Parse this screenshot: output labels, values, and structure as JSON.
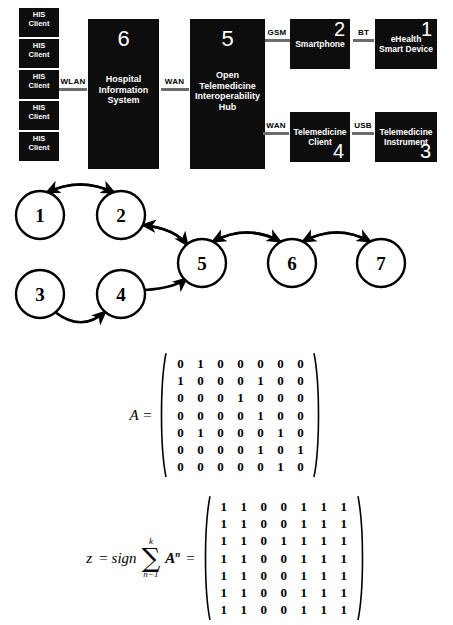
{
  "architecture": {
    "his_clients": [
      {
        "line1": "HIS",
        "line2": "Client"
      },
      {
        "line1": "HIS",
        "line2": "Client"
      },
      {
        "line1": "HIS",
        "line2": "Client"
      },
      {
        "line1": "HIS",
        "line2": "Client"
      },
      {
        "line1": "HIS",
        "line2": "Client"
      }
    ],
    "blocks": {
      "hospital_information_system": {
        "number": "6",
        "line1": "Hospital",
        "line2": "Information",
        "line3": "System"
      },
      "open_telemedicine_hub": {
        "number": "5",
        "line1": "Open",
        "line2": "Telemedicine",
        "line3": "Interoperability",
        "line4": "Hub"
      },
      "smartphone": {
        "number": "2",
        "line1": "Smartphone"
      },
      "ehealth_smart_device": {
        "number": "1",
        "line1": "eHealth",
        "line2": "Smart Device"
      },
      "telemedicine_client": {
        "number": "4",
        "line1": "Telemedicine",
        "line2": "Client"
      },
      "telemedicine_instrument": {
        "number": "3",
        "line1": "Telemedicine",
        "line2": "Instrument"
      }
    },
    "links": {
      "wlan": "WLAN",
      "wan_hub": "WAN",
      "gsm": "GSM",
      "bt": "BT",
      "wan_client": "WAN",
      "usb": "USB"
    },
    "colors": {
      "block_fill": "#0d0d0d",
      "block_text": "#ffffff",
      "connector_bar": "#6b6b6b"
    }
  },
  "graph": {
    "nodes": [
      {
        "id": "1",
        "label": "1",
        "cx": 40,
        "cy": 37
      },
      {
        "id": "2",
        "label": "2",
        "cx": 121,
        "cy": 37
      },
      {
        "id": "3",
        "label": "3",
        "cx": 40,
        "cy": 116
      },
      {
        "id": "4",
        "label": "4",
        "cx": 121,
        "cy": 116
      },
      {
        "id": "5",
        "label": "5",
        "cx": 202,
        "cy": 85
      },
      {
        "id": "6",
        "label": "6",
        "cx": 292,
        "cy": 85
      },
      {
        "id": "7",
        "label": "7",
        "cx": 381,
        "cy": 85
      }
    ],
    "radius": 24,
    "edges": [
      {
        "from": "1",
        "to": "2",
        "bidirectional": true
      },
      {
        "from": "2",
        "to": "5",
        "bidirectional": true
      },
      {
        "from": "3",
        "to": "4",
        "bidirectional": false
      },
      {
        "from": "4",
        "to": "5",
        "bidirectional": false
      },
      {
        "from": "5",
        "to": "6",
        "bidirectional": true
      },
      {
        "from": "6",
        "to": "7",
        "bidirectional": true
      }
    ],
    "colors": {
      "stroke": "#000000",
      "fill": "#ffffff"
    }
  },
  "matrix_a": {
    "label": "A =",
    "rows": [
      [
        "0",
        "1",
        "0",
        "0",
        "0",
        "0",
        "0"
      ],
      [
        "1",
        "0",
        "0",
        "0",
        "1",
        "0",
        "0"
      ],
      [
        "0",
        "0",
        "0",
        "1",
        "0",
        "0",
        "0"
      ],
      [
        "0",
        "0",
        "0",
        "0",
        "1",
        "0",
        "0"
      ],
      [
        "0",
        "1",
        "0",
        "0",
        "0",
        "1",
        "0"
      ],
      [
        "0",
        "0",
        "0",
        "0",
        "1",
        "0",
        "1"
      ],
      [
        "0",
        "0",
        "0",
        "0",
        "0",
        "1",
        "0"
      ]
    ]
  },
  "equation_z": {
    "z": "z",
    "equals": "=",
    "sign": "sign",
    "sigma": "∑",
    "upper_limit": "k",
    "lower_limit": "n−1",
    "term_base": "A",
    "term_exponent": "n",
    "equals2": "=",
    "rows": [
      [
        "1",
        "1",
        "0",
        "0",
        "1",
        "1",
        "1"
      ],
      [
        "1",
        "1",
        "0",
        "0",
        "1",
        "1",
        "1"
      ],
      [
        "1",
        "1",
        "0",
        "1",
        "1",
        "1",
        "1"
      ],
      [
        "1",
        "1",
        "0",
        "0",
        "1",
        "1",
        "1"
      ],
      [
        "1",
        "1",
        "0",
        "0",
        "1",
        "1",
        "1"
      ],
      [
        "1",
        "1",
        "0",
        "0",
        "1",
        "1",
        "1"
      ],
      [
        "1",
        "1",
        "0",
        "0",
        "1",
        "1",
        "1"
      ]
    ]
  }
}
